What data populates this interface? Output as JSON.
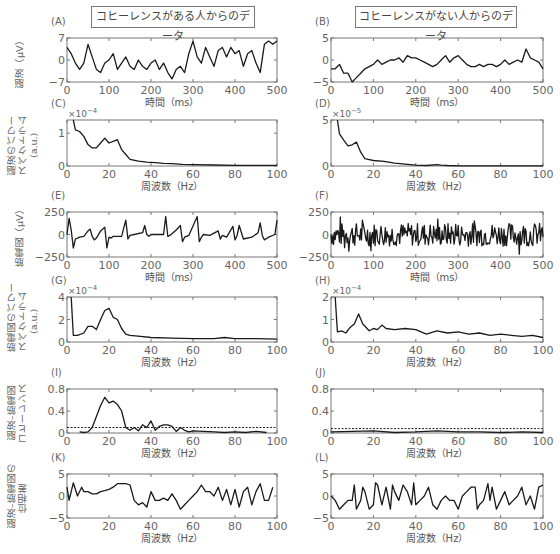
{
  "headers": {
    "left_title": "コヒーレンスがある人からのデータ",
    "right_title": "コヒーレンスがない人からのデータ"
  },
  "row_ylabels": [
    {
      "text": "脳波（μV）"
    },
    {
      "text": "脳波のパワー\nスペクトラム\n(a.u.)"
    },
    {
      "text": "筋電図（μV）"
    },
    {
      "text": "筋電図のパワー\nスペクトラム\n(a.u.)"
    },
    {
      "text": "脳波–筋電図\nコヒーレンス"
    },
    {
      "text": "脳波–筋電図の\n位相差"
    }
  ],
  "chart_data": [
    {
      "id": "A",
      "type": "line",
      "label": "(A)",
      "title": "コヒーレンスがある人からのデータ",
      "xlabel": "時間（ms）",
      "ylabel": "脳波（μV）",
      "xlim": [
        0,
        500
      ],
      "ylim": [
        -7,
        7
      ],
      "xticks": [
        0,
        100,
        200,
        300,
        400,
        500
      ],
      "yticks": [
        -7,
        0,
        7
      ],
      "x": [
        0,
        10,
        20,
        30,
        40,
        50,
        60,
        70,
        80,
        90,
        100,
        110,
        120,
        130,
        140,
        150,
        160,
        170,
        180,
        190,
        200,
        210,
        220,
        230,
        240,
        250,
        260,
        270,
        280,
        290,
        300,
        310,
        320,
        330,
        340,
        350,
        360,
        370,
        380,
        390,
        400,
        410,
        420,
        430,
        440,
        450,
        460,
        470,
        480,
        490,
        500
      ],
      "values": [
        4,
        2,
        -1,
        -3,
        -1,
        5,
        1,
        -3,
        -4,
        -1,
        0,
        2,
        -3,
        -1,
        1,
        -2,
        -3,
        0,
        -2,
        -3,
        -1,
        0,
        -3,
        -1,
        -4,
        -6,
        -3,
        -2,
        -4,
        2,
        6,
        1,
        -1,
        4,
        1,
        -2,
        3,
        4,
        1,
        4,
        2,
        3,
        -2,
        2,
        3,
        -1,
        -4,
        5,
        6,
        5,
        6
      ]
    },
    {
      "id": "B",
      "type": "line",
      "label": "(B)",
      "title": "コヒーレンスがない人からのデータ",
      "xlabel": "時間（ms）",
      "xlim": [
        0,
        500
      ],
      "ylim": [
        -5,
        5
      ],
      "xticks": [
        0,
        100,
        200,
        300,
        400,
        500
      ],
      "yticks": [
        -5,
        0,
        5
      ],
      "x": [
        0,
        10,
        20,
        30,
        40,
        50,
        60,
        70,
        80,
        90,
        100,
        110,
        120,
        130,
        140,
        150,
        160,
        170,
        180,
        190,
        200,
        210,
        220,
        230,
        240,
        250,
        260,
        270,
        280,
        290,
        300,
        310,
        320,
        330,
        340,
        350,
        360,
        370,
        380,
        390,
        400,
        410,
        420,
        430,
        440,
        450,
        460,
        470,
        480,
        490,
        500
      ],
      "values": [
        -2,
        -2,
        -1,
        -3,
        -3,
        -5,
        -4,
        -3,
        -2,
        -1.5,
        -1,
        0,
        -1,
        -0.5,
        0,
        0,
        0.5,
        -0.5,
        1,
        0.5,
        0.5,
        0,
        -0.5,
        -1,
        -1.5,
        -1,
        0,
        1,
        -0.5,
        0.5,
        1,
        0,
        -1,
        -1.5,
        -1.5,
        -1,
        -1.5,
        -1,
        -1,
        -1.5,
        -1,
        0,
        -1,
        -0.5,
        0,
        -0.5,
        2.5,
        0.5,
        0,
        -0.5,
        -2
      ]
    },
    {
      "id": "C",
      "type": "line",
      "label": "(C)",
      "xlabel": "周波数（Hz）",
      "ylabel": "脳波のパワースペクトラム (a.u.)",
      "xlim": [
        0,
        100
      ],
      "ylim": [
        0,
        1.4
      ],
      "scale_note": "×10^-4",
      "xticks": [
        0,
        20,
        40,
        60,
        80,
        100
      ],
      "yticks": [
        0,
        1
      ],
      "x": [
        3,
        4,
        6,
        8,
        10,
        12,
        14,
        16,
        18,
        20,
        22,
        24,
        26,
        28,
        30,
        34,
        38,
        42,
        46,
        50,
        55,
        60,
        70,
        80,
        90,
        100
      ],
      "values": [
        1.4,
        1.1,
        1.05,
        0.9,
        0.65,
        0.55,
        0.55,
        0.7,
        0.85,
        0.7,
        0.75,
        0.8,
        0.5,
        0.35,
        0.2,
        0.15,
        0.12,
        0.1,
        0.08,
        0.07,
        0.05,
        0.04,
        0.03,
        0.02,
        0.02,
        0.02
      ]
    },
    {
      "id": "D",
      "type": "line",
      "label": "(D)",
      "xlabel": "周波数（Hz）",
      "xlim": [
        0,
        100
      ],
      "ylim": [
        0,
        5
      ],
      "scale_note": "×10^-5",
      "xticks": [
        0,
        20,
        40,
        60,
        80,
        100
      ],
      "yticks": [
        0,
        5
      ],
      "x": [
        3,
        4,
        6,
        8,
        10,
        12,
        14,
        16,
        18,
        20,
        25,
        30,
        35,
        40,
        45,
        50,
        52,
        55,
        60,
        70,
        80,
        90,
        100
      ],
      "values": [
        5,
        3.5,
        2.8,
        2.2,
        2.3,
        2.6,
        1.5,
        0.8,
        0.7,
        0.6,
        0.5,
        0.3,
        0.2,
        0.1,
        0.05,
        0.15,
        0.1,
        0.05,
        0.02,
        0.02,
        0.02,
        0.02,
        0.02
      ]
    },
    {
      "id": "E",
      "type": "line",
      "label": "(E)",
      "xlabel": "時間（ms）",
      "ylabel": "筋電図（μV）",
      "xlim": [
        0,
        500
      ],
      "ylim": [
        -250,
        250
      ],
      "xticks": [
        0,
        100,
        200,
        300,
        400,
        500
      ],
      "yticks": [
        -250,
        0,
        250
      ],
      "x": [
        0,
        5,
        10,
        15,
        20,
        30,
        40,
        50,
        55,
        60,
        65,
        70,
        80,
        90,
        95,
        100,
        105,
        110,
        130,
        140,
        145,
        150,
        160,
        180,
        185,
        190,
        195,
        200,
        230,
        235,
        240,
        245,
        260,
        270,
        275,
        280,
        290,
        310,
        315,
        320,
        325,
        340,
        360,
        365,
        370,
        380,
        395,
        400,
        405,
        410,
        420,
        440,
        455,
        460,
        465,
        470,
        480,
        495,
        500
      ],
      "values": [
        0,
        180,
        50,
        -150,
        -50,
        -30,
        -20,
        40,
        60,
        -20,
        -60,
        -40,
        40,
        80,
        -150,
        -30,
        -40,
        -20,
        -20,
        160,
        -50,
        -10,
        0,
        20,
        100,
        0,
        -20,
        0,
        0,
        200,
        -20,
        -10,
        50,
        100,
        -80,
        -30,
        -10,
        200,
        -80,
        -30,
        0,
        -10,
        40,
        -50,
        -10,
        -30,
        90,
        -60,
        -10,
        100,
        -50,
        -30,
        20,
        130,
        -10,
        -60,
        -30,
        0,
        160
      ]
    },
    {
      "id": "F",
      "type": "line",
      "label": "(F)",
      "xlabel": "時間（ms）",
      "xlim": [
        0,
        500
      ],
      "ylim": [
        -250,
        250
      ],
      "xticks": [
        0,
        100,
        200,
        300,
        400,
        500
      ],
      "yticks": [
        -250,
        0,
        250
      ],
      "note": "dense high-frequency noise across full range ±200"
    },
    {
      "id": "G",
      "type": "line",
      "label": "(G)",
      "xlabel": "周波数（Hz）",
      "ylabel": "筋電図のパワースペクトラム (a.u.)",
      "xlim": [
        0,
        100
      ],
      "ylim": [
        0,
        4
      ],
      "scale_note": "×10^-4",
      "xticks": [
        0,
        20,
        40,
        60,
        80,
        100
      ],
      "yticks": [
        0,
        2,
        4
      ],
      "x": [
        2,
        3,
        5,
        8,
        10,
        12,
        14,
        16,
        18,
        20,
        22,
        24,
        26,
        28,
        30,
        35,
        40,
        50,
        60,
        70,
        75,
        80,
        90,
        100
      ],
      "values": [
        4,
        0.6,
        0.6,
        0.8,
        1.4,
        1.4,
        1.1,
        2,
        2.8,
        3,
        2.2,
        2,
        1.2,
        0.7,
        0.6,
        0.5,
        0.4,
        0.35,
        0.3,
        0.3,
        0.4,
        0.3,
        0.3,
        0.25
      ]
    },
    {
      "id": "H",
      "type": "line",
      "label": "(H)",
      "xlabel": "周波数（Hz）",
      "xlim": [
        0,
        100
      ],
      "ylim": [
        0,
        2
      ],
      "scale_note": "×10^-4",
      "xticks": [
        0,
        20,
        40,
        60,
        80,
        100
      ],
      "yticks": [
        0,
        1,
        2
      ],
      "x": [
        2,
        3,
        5,
        7,
        9,
        11,
        13,
        15,
        18,
        20,
        22,
        24,
        26,
        30,
        35,
        40,
        45,
        50,
        55,
        60,
        65,
        70,
        75,
        80,
        85,
        90,
        95,
        100
      ],
      "values": [
        2,
        0.45,
        0.5,
        0.4,
        0.65,
        0.8,
        1.25,
        0.8,
        0.5,
        0.6,
        0.55,
        0.75,
        0.6,
        0.55,
        0.6,
        0.55,
        0.35,
        0.5,
        0.4,
        0.45,
        0.35,
        0.4,
        0.3,
        0.35,
        0.3,
        0.25,
        0.3,
        0.2
      ]
    },
    {
      "id": "I",
      "type": "line",
      "label": "(I)",
      "xlabel": "周波数（Hz）",
      "ylabel": "脳波–筋電図コヒーレンス",
      "xlim": [
        0,
        100
      ],
      "ylim": [
        0,
        0.8
      ],
      "xticks": [
        0,
        20,
        40,
        60,
        80,
        100
      ],
      "yticks": [
        0,
        0.4,
        0.8
      ],
      "threshold": 0.1,
      "x": [
        6,
        8,
        10,
        12,
        14,
        16,
        18,
        20,
        22,
        24,
        26,
        28,
        30,
        32,
        34,
        36,
        38,
        40,
        42,
        44,
        46,
        48,
        50,
        52,
        54,
        56,
        58,
        60,
        65,
        70,
        75,
        80,
        85,
        90,
        95
      ],
      "values": [
        0.02,
        0.01,
        0.02,
        0.1,
        0.3,
        0.5,
        0.65,
        0.55,
        0.58,
        0.52,
        0.4,
        0.1,
        0.05,
        0.1,
        0.04,
        0.15,
        0.1,
        0.22,
        0.05,
        0.12,
        0.15,
        0.15,
        0.12,
        0.03,
        0.1,
        0.05,
        0.02,
        0.04,
        0.03,
        0.02,
        0.01,
        0.02,
        0.01,
        0.03,
        0.01
      ]
    },
    {
      "id": "J",
      "type": "line",
      "label": "(J)",
      "xlabel": "周波数（Hz）",
      "xlim": [
        0,
        100
      ],
      "ylim": [
        0,
        0.8
      ],
      "xticks": [
        0,
        20,
        40,
        60,
        80,
        100
      ],
      "yticks": [
        0,
        0.4,
        0.8
      ],
      "threshold": 0.08,
      "x": [
        0,
        10,
        20,
        30,
        40,
        50,
        60,
        70,
        80,
        90,
        100
      ],
      "values": [
        0.02,
        0.03,
        0.04,
        0.01,
        0.02,
        0.04,
        0.02,
        0.02,
        0.01,
        0.02,
        0.01
      ]
    },
    {
      "id": "K",
      "type": "line",
      "label": "(K)",
      "xlabel": "周波数（Hz）",
      "ylabel": "脳波–筋電図の位相差",
      "xlim": [
        0,
        100
      ],
      "ylim": [
        -5,
        5
      ],
      "xticks": [
        0,
        20,
        40,
        60,
        80,
        100
      ],
      "yticks": [
        -5,
        0,
        5
      ],
      "x": [
        0,
        1,
        2,
        3,
        5,
        7,
        8,
        10,
        12,
        14,
        16,
        18,
        20,
        22,
        24,
        26,
        28,
        30,
        32,
        34,
        36,
        38,
        40,
        42,
        44,
        46,
        48,
        50,
        52,
        54,
        56,
        58,
        60,
        62,
        64,
        66,
        68,
        70,
        72,
        74,
        76,
        78,
        80,
        82,
        84,
        86,
        88,
        90,
        92,
        94,
        96,
        98
      ],
      "values": [
        2,
        -1,
        1,
        3,
        0,
        2,
        1,
        1,
        0.5,
        0.5,
        1,
        1.2,
        1.5,
        2,
        2.8,
        2.8,
        2.8,
        2.5,
        -1,
        -2,
        -1.5,
        -2.5,
        1,
        -1,
        -1,
        -0.5,
        -1,
        0.5,
        -1,
        -3,
        -2,
        -1,
        0,
        1,
        2.5,
        1,
        1,
        0,
        2,
        -1,
        1.5,
        -2,
        1.5,
        -2.5,
        1,
        2,
        -2,
        1,
        2.8,
        -1,
        -1,
        2
      ]
    },
    {
      "id": "L",
      "type": "line",
      "label": "(L)",
      "xlabel": "周波数（Hz）",
      "xlim": [
        0,
        100
      ],
      "ylim": [
        -5,
        5
      ],
      "xticks": [
        0,
        20,
        40,
        60,
        80,
        100
      ],
      "yticks": [
        -5,
        0,
        5
      ],
      "x": [
        0,
        2,
        4,
        6,
        8,
        10,
        11,
        12,
        14,
        15,
        16,
        18,
        20,
        21,
        22,
        24,
        26,
        28,
        29,
        30,
        32,
        34,
        36,
        38,
        39,
        40,
        42,
        44,
        46,
        48,
        50,
        52,
        54,
        56,
        58,
        60,
        62,
        64,
        66,
        68,
        69,
        70,
        72,
        74,
        75,
        76,
        78,
        80,
        82,
        84,
        86,
        88,
        90,
        92,
        94,
        96,
        98,
        100
      ],
      "values": [
        0,
        -1,
        -3,
        -2,
        -1,
        -1,
        2.5,
        -3,
        -1,
        2,
        1,
        -3,
        -2,
        3,
        2.5,
        -2,
        2,
        -3,
        2.5,
        1,
        -1,
        2.5,
        1,
        -2,
        3,
        -2,
        -1,
        0,
        2,
        -2,
        -3,
        -1,
        0,
        -1,
        -1,
        -3,
        0,
        1,
        2,
        2,
        -3,
        -2,
        -1,
        2.8,
        -1,
        2,
        -3,
        -1,
        1,
        -2,
        -1,
        0,
        2,
        -2,
        0,
        -3,
        2,
        2.5
      ]
    }
  ]
}
